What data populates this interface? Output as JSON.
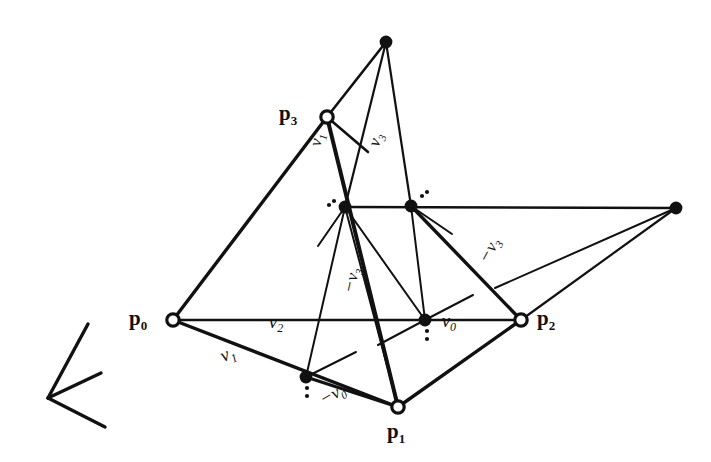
{
  "figure": {
    "background_color": "#ffffff",
    "ink_color": "#111111",
    "vertices": [
      {
        "name": "p0",
        "label": "p",
        "sub": "0",
        "marker": "open-circle",
        "x": 173,
        "y": 320
      },
      {
        "name": "p1",
        "label": "p",
        "sub": "1",
        "marker": "open-circle",
        "x": 398,
        "y": 407
      },
      {
        "name": "p2",
        "label": "p",
        "sub": "2",
        "marker": "open-circle",
        "x": 521,
        "y": 320
      },
      {
        "name": "p3",
        "label": "p",
        "sub": "3",
        "marker": "open-circle",
        "x": 327,
        "y": 117
      },
      {
        "name": "apex-top",
        "label": "",
        "sub": "",
        "marker": "filled-dot",
        "x": 386,
        "y": 42
      },
      {
        "name": "right-far",
        "label": "",
        "sub": "",
        "marker": "filled-dot",
        "x": 676,
        "y": 208
      },
      {
        "name": "mid-left",
        "label": "",
        "sub": "",
        "marker": "filled-dot",
        "x": 345,
        "y": 207
      },
      {
        "name": "mid-right",
        "label": "",
        "sub": "",
        "marker": "filled-dot",
        "x": 411,
        "y": 206
      },
      {
        "name": "lower-mid",
        "label": "",
        "sub": "",
        "marker": "filled-dot",
        "x": 425,
        "y": 320
      },
      {
        "name": "lower-left",
        "label": "",
        "sub": "",
        "marker": "filled-dot",
        "x": 306,
        "y": 377
      }
    ],
    "vector_labels": [
      {
        "name": "v1-edge-p0p1",
        "minus": "",
        "sym": "v",
        "sub": "1",
        "x": 228,
        "y": 355,
        "rotate": -24,
        "size": 19
      },
      {
        "name": "v2-edge-p0p2",
        "minus": "",
        "sym": "v",
        "sub": "2",
        "x": 276,
        "y": 323,
        "rotate": 0,
        "size": 19
      },
      {
        "name": "v1-edge-p3",
        "minus": "",
        "sym": "v",
        "sub": "1",
        "x": 318,
        "y": 140,
        "rotate": -80,
        "size": 17
      },
      {
        "name": "v3-edge-upper",
        "minus": "",
        "sym": "v",
        "sub": "3",
        "x": 377,
        "y": 140,
        "rotate": -72,
        "size": 17
      },
      {
        "name": "neg-v3-middle",
        "minus": "−",
        "sym": "v",
        "sub": "3",
        "x": 352,
        "y": 280,
        "rotate": -78,
        "size": 17
      },
      {
        "name": "neg-v3-right",
        "minus": "−",
        "sym": "v",
        "sub": "3",
        "x": 490,
        "y": 250,
        "rotate": -62,
        "size": 17
      },
      {
        "name": "neg-v0-lower-mid",
        "minus": "−",
        "sym": "v",
        "sub": "0",
        "x": 443,
        "y": 322,
        "rotate": 0,
        "size": 19
      },
      {
        "name": "neg-v0-bottom",
        "minus": "−",
        "sym": "v",
        "sub": "0",
        "x": 333,
        "y": 395,
        "rotate": -30,
        "size": 17
      }
    ],
    "edges": [
      {
        "name": "edge-p0-p3",
        "x1": 173,
        "y1": 320,
        "x2": 327,
        "y2": 117,
        "width": 3.4
      },
      {
        "name": "edge-p0-p2",
        "x1": 173,
        "y1": 320,
        "x2": 521,
        "y2": 320,
        "width": 2.6
      },
      {
        "name": "edge-p0-p1",
        "x1": 173,
        "y1": 320,
        "x2": 398,
        "y2": 407,
        "width": 3.4
      },
      {
        "name": "edge-p1-p2",
        "x1": 398,
        "y1": 407,
        "x2": 521,
        "y2": 320,
        "width": 3.4
      },
      {
        "name": "edge-p3-p1",
        "x1": 327,
        "y1": 117,
        "x2": 398,
        "y2": 407,
        "width": 4.0
      },
      {
        "name": "edge-p3-apex",
        "x1": 327,
        "y1": 117,
        "x2": 386,
        "y2": 42,
        "width": 2.6
      },
      {
        "name": "edge-apex-midleft",
        "x1": 386,
        "y1": 42,
        "x2": 345,
        "y2": 207,
        "width": 2.2
      },
      {
        "name": "edge-apex-midright",
        "x1": 386,
        "y1": 42,
        "x2": 411,
        "y2": 206,
        "width": 2.2
      },
      {
        "name": "edge-midleft-lowermid",
        "x1": 345,
        "y1": 207,
        "x2": 425,
        "y2": 320,
        "width": 2.0
      },
      {
        "name": "edge-midright-lowermid",
        "x1": 411,
        "y1": 206,
        "x2": 425,
        "y2": 320,
        "width": 2.0
      },
      {
        "name": "edge-midleft-p1",
        "x1": 345,
        "y1": 207,
        "x2": 398,
        "y2": 407,
        "width": 2.0
      },
      {
        "name": "edge-midleft-lowerleft",
        "x1": 345,
        "y1": 207,
        "x2": 306,
        "y2": 377,
        "width": 2.0
      },
      {
        "name": "edge-midleft-midright",
        "x1": 345,
        "y1": 207,
        "x2": 676,
        "y2": 208,
        "width": 2.6
      },
      {
        "name": "edge-midright-p2",
        "x1": 411,
        "y1": 206,
        "x2": 521,
        "y2": 320,
        "width": 3.4
      },
      {
        "name": "edge-farright-p2",
        "x1": 676,
        "y1": 208,
        "x2": 521,
        "y2": 320,
        "width": 2.2
      },
      {
        "name": "edge-farright-tick",
        "x1": 676,
        "y1": 208,
        "x2": 495,
        "y2": 288,
        "width": 2.0
      },
      {
        "name": "edge-lowerleft-p1",
        "x1": 306,
        "y1": 377,
        "x2": 398,
        "y2": 407,
        "width": 3.2
      },
      {
        "name": "tick-p3-a",
        "x1": 327,
        "y1": 117,
        "x2": 368,
        "y2": 152,
        "width": 2.6
      },
      {
        "name": "tick-lowerleft-a",
        "x1": 306,
        "y1": 377,
        "x2": 356,
        "y2": 352,
        "width": 2.0
      },
      {
        "name": "tick-lowermid-a",
        "x1": 425,
        "y1": 320,
        "x2": 473,
        "y2": 295,
        "width": 2.0
      },
      {
        "name": "tick-lowermid-b",
        "x1": 425,
        "y1": 320,
        "x2": 378,
        "y2": 345,
        "width": 2.0
      },
      {
        "name": "tick-midright-a",
        "x1": 411,
        "y1": 206,
        "x2": 452,
        "y2": 234,
        "width": 2.0
      },
      {
        "name": "tick-midleft-b",
        "x1": 345,
        "y1": 207,
        "x2": 318,
        "y2": 246,
        "width": 2.0
      }
    ],
    "dot_markers": [
      {
        "name": "dot-pair-midleft-a",
        "x": 329,
        "y": 205
      },
      {
        "name": "dot-pair-midleft-b",
        "x": 334,
        "y": 201
      },
      {
        "name": "dot-pair-midright-a",
        "x": 422,
        "y": 196
      },
      {
        "name": "dot-pair-midright-b",
        "x": 427,
        "y": 192
      },
      {
        "name": "dot-pair-lowermid-a",
        "x": 427,
        "y": 331
      },
      {
        "name": "dot-pair-lowermid-b",
        "x": 427,
        "y": 339
      },
      {
        "name": "dot-pair-lowerleft-a",
        "x": 307,
        "y": 388
      },
      {
        "name": "dot-pair-lowerleft-b",
        "x": 307,
        "y": 396
      }
    ],
    "axis_marker": {
      "name": "orientation-arrow",
      "strokes": [
        {
          "x1": 48,
          "y1": 398,
          "x2": 88,
          "y2": 324
        },
        {
          "x1": 48,
          "y1": 398,
          "x2": 101,
          "y2": 373
        },
        {
          "x1": 48,
          "y1": 398,
          "x2": 105,
          "y2": 427
        }
      ]
    }
  }
}
